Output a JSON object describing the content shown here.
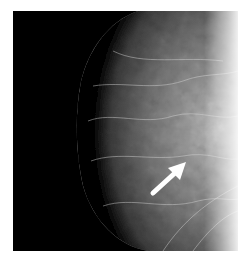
{
  "image": {
    "description": "Mammogram X-ray image of breast tissue with a white arrow indicating a region of interest",
    "alt": "Mammogram with arrow",
    "colors": {
      "background": "#000000",
      "border": "#ffffff",
      "arrow": "#ffffff",
      "tissue": "#8a8a8a"
    }
  },
  "annotation": {
    "type": "arrow",
    "direction": "up-right",
    "from": [
      152,
      194
    ],
    "to": [
      185,
      163
    ]
  }
}
